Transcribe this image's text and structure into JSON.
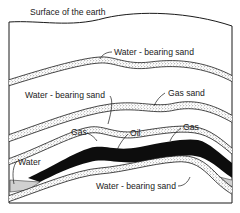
{
  "diagram": {
    "type": "geological cross-section",
    "labels": {
      "surface": "Surface of the earth",
      "water_sand_upper": "Water - bearing sand",
      "water_sand_middle": "Water - bearing sand",
      "gas_sand": "Gas sand",
      "gas_left": "Gas",
      "oil": "Oil",
      "gas_right": "Gas",
      "water": "Water",
      "water_sand_lower": "Water - bearing sand"
    },
    "colors": {
      "line": "#1a1a1a",
      "oil": "#0d0d0d",
      "sand_fill": "#e8e8e8",
      "background": "#ffffff"
    }
  }
}
